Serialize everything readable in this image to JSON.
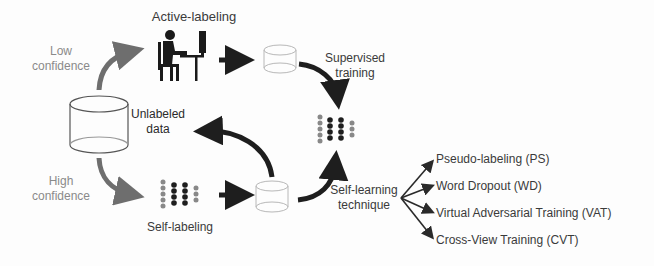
{
  "diagram": {
    "nodes": {
      "active_labeling": {
        "label": "Active-labeling",
        "icon": "person-at-computer-icon"
      },
      "self_labeling": {
        "label": "Self-labeling",
        "icon": "neural-network-icon"
      },
      "unlabeled_data": {
        "label_line1": "Unlabeled",
        "label_line2": "data",
        "icon": "database-cylinder-icon"
      },
      "labeled_data_active": {
        "icon": "database-cylinder-icon"
      },
      "labeled_data_self": {
        "icon": "database-cylinder-icon"
      },
      "model": {
        "icon": "neural-network-icon"
      }
    },
    "edges": {
      "low_confidence": {
        "line1": "Low",
        "line2": "confidence"
      },
      "high_confidence": {
        "line1": "High",
        "line2": "confidence"
      },
      "supervised_training": {
        "line1": "Supervised",
        "line2": "training"
      },
      "self_learning": {
        "line1": "Self-learning",
        "line2": "technique"
      }
    },
    "techniques": [
      "Pseudo-labeling (PS)",
      "Word Dropout (WD)",
      "Virtual Adversarial Training (VAT)",
      "Cross-View Training (CVT)"
    ],
    "colors": {
      "arrow_dark": "#1e1e1e",
      "arrow_gray": "#6e6e6e",
      "text_gray": "#8a8a8a",
      "text_dark": "#333333",
      "cylinder_stroke_dark": "#555555",
      "cylinder_stroke_light": "#b8b8b8"
    }
  }
}
